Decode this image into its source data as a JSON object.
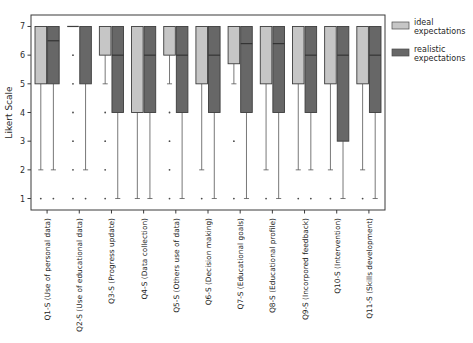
{
  "chart_data": {
    "type": "box",
    "title": "",
    "xlabel": "",
    "ylabel": "Likert Scale",
    "ylim": [
      0.6,
      7.4
    ],
    "yticks": [
      1,
      2,
      3,
      4,
      5,
      6,
      7
    ],
    "ytick_labels": [
      "1",
      "2",
      "3",
      "4",
      "5",
      "6",
      "7"
    ],
    "grid": false,
    "legend_position": "right",
    "categories": [
      "Q1-S (Use of personal data)",
      "Q2-S (Use of educational data)",
      "Q3-S (Progress update)",
      "Q4-S (Data collection)",
      "Q5-S (Others use of data)",
      "Q6-S (Decision making)",
      "Q7-S (Educational goals)",
      "Q8-S (Educational profile)",
      "Q9-S (Incorpored feedback)",
      "Q10-S (Intervention)",
      "Q11-S (Skills development)"
    ],
    "series": [
      {
        "name": "ideal expectations",
        "color": "#c6c6c6",
        "boxes": [
          {
            "q1": 5.0,
            "median": 7.0,
            "q3": 7.0,
            "whisker_low": 2.0,
            "whisker_high": 7.0,
            "outliers": [
              1.0
            ]
          },
          {
            "q1": 7.0,
            "median": 7.0,
            "q3": 7.0,
            "whisker_low": 7.0,
            "whisker_high": 7.0,
            "outliers": [
              6.0,
              5.0,
              4.0,
              3.0,
              2.0,
              1.0
            ]
          },
          {
            "q1": 6.0,
            "median": 6.0,
            "q3": 7.0,
            "whisker_low": 5.0,
            "whisker_high": 7.0,
            "outliers": [
              4.0,
              3.0,
              2.0,
              1.0
            ]
          },
          {
            "q1": 4.0,
            "median": 7.0,
            "q3": 7.0,
            "whisker_low": 1.0,
            "whisker_high": 7.0,
            "outliers": []
          },
          {
            "q1": 6.0,
            "median": 6.0,
            "q3": 7.0,
            "whisker_low": 5.0,
            "whisker_high": 7.0,
            "outliers": [
              4.0,
              3.0,
              2.0,
              1.0
            ]
          },
          {
            "q1": 5.0,
            "median": 7.0,
            "q3": 7.0,
            "whisker_low": 2.0,
            "whisker_high": 7.0,
            "outliers": [
              1.0
            ]
          },
          {
            "q1": 5.7,
            "median": 7.0,
            "q3": 7.0,
            "whisker_low": 5.0,
            "whisker_high": 7.0,
            "outliers": [
              3.0,
              1.0
            ]
          },
          {
            "q1": 5.0,
            "median": 7.0,
            "q3": 7.0,
            "whisker_low": 2.0,
            "whisker_high": 7.0,
            "outliers": [
              1.0
            ]
          },
          {
            "q1": 5.0,
            "median": 7.0,
            "q3": 7.0,
            "whisker_low": 2.0,
            "whisker_high": 7.0,
            "outliers": [
              1.0
            ]
          },
          {
            "q1": 5.0,
            "median": 7.0,
            "q3": 7.0,
            "whisker_low": 2.0,
            "whisker_high": 7.0,
            "outliers": [
              1.0
            ]
          },
          {
            "q1": 5.0,
            "median": 7.0,
            "q3": 7.0,
            "whisker_low": 2.0,
            "whisker_high": 7.0,
            "outliers": [
              1.0
            ]
          }
        ]
      },
      {
        "name": "realistic expectations",
        "color": "#676767",
        "boxes": [
          {
            "q1": 5.0,
            "median": 6.5,
            "q3": 7.0,
            "whisker_low": 2.0,
            "whisker_high": 7.0,
            "outliers": [
              1.0
            ]
          },
          {
            "q1": 5.0,
            "median": 7.0,
            "q3": 7.0,
            "whisker_low": 2.0,
            "whisker_high": 7.0,
            "outliers": [
              1.0
            ]
          },
          {
            "q1": 4.0,
            "median": 6.0,
            "q3": 7.0,
            "whisker_low": 1.0,
            "whisker_high": 7.0,
            "outliers": []
          },
          {
            "q1": 4.0,
            "median": 6.0,
            "q3": 7.0,
            "whisker_low": 1.0,
            "whisker_high": 7.0,
            "outliers": []
          },
          {
            "q1": 4.0,
            "median": 6.0,
            "q3": 7.0,
            "whisker_low": 1.0,
            "whisker_high": 7.0,
            "outliers": []
          },
          {
            "q1": 4.0,
            "median": 6.0,
            "q3": 7.0,
            "whisker_low": 1.0,
            "whisker_high": 7.0,
            "outliers": []
          },
          {
            "q1": 4.0,
            "median": 6.4,
            "q3": 7.0,
            "whisker_low": 1.0,
            "whisker_high": 7.0,
            "outliers": []
          },
          {
            "q1": 4.0,
            "median": 6.4,
            "q3": 7.0,
            "whisker_low": 1.0,
            "whisker_high": 7.0,
            "outliers": []
          },
          {
            "q1": 4.0,
            "median": 6.0,
            "q3": 7.0,
            "whisker_low": 2.0,
            "whisker_high": 7.0,
            "outliers": [
              1.0
            ]
          },
          {
            "q1": 3.0,
            "median": 6.0,
            "q3": 7.0,
            "whisker_low": 1.0,
            "whisker_high": 7.0,
            "outliers": []
          },
          {
            "q1": 4.0,
            "median": 6.0,
            "q3": 7.0,
            "whisker_low": 1.0,
            "whisker_high": 7.0,
            "outliers": []
          }
        ]
      }
    ]
  },
  "legend": {
    "items": [
      {
        "label_line1": "ideal",
        "label_line2": "expectations",
        "color": "#c6c6c6"
      },
      {
        "label_line1": "realistic",
        "label_line2": "expectations",
        "color": "#676767"
      }
    ]
  }
}
